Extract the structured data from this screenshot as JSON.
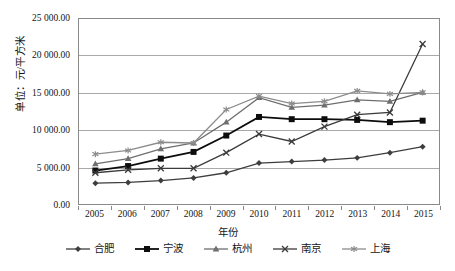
{
  "chart_data": {
    "type": "line",
    "title": "",
    "xlabel": "年份",
    "ylabel": "单位：元/平方米",
    "categories": [
      "2005",
      "2006",
      "2007",
      "2008",
      "2009",
      "2010",
      "2011",
      "2012",
      "2013",
      "2014",
      "2015"
    ],
    "ylim": [
      0,
      25000
    ],
    "ytick_labels": [
      "0.00",
      "5 000.00",
      "10 000.00",
      "15 000.00",
      "20 000.00",
      "25 000.00"
    ],
    "ytick_values": [
      0,
      5000,
      10000,
      15000,
      20000,
      25000
    ],
    "grid": true,
    "legend_position": "bottom",
    "series": [
      {
        "name": "合肥",
        "marker": "diamond",
        "color": "#3d3d3d",
        "values": [
          2800,
          2900,
          3150,
          3500,
          4200,
          5500,
          5700,
          5900,
          6200,
          6900,
          7700
        ]
      },
      {
        "name": "宁波",
        "marker": "square",
        "color": "#0d0d0d",
        "values": [
          4500,
          5100,
          6100,
          7000,
          9200,
          11700,
          11400,
          11400,
          11300,
          11000,
          11200
        ]
      },
      {
        "name": "杭州",
        "marker": "triangle",
        "color": "#6e6e6e",
        "values": [
          5400,
          6100,
          7400,
          8200,
          11000,
          14300,
          13000,
          13300,
          14000,
          13800,
          15000
        ]
      },
      {
        "name": "南京",
        "marker": "x-cross",
        "color": "#3a3a3a",
        "values": [
          4200,
          4600,
          4800,
          4800,
          6900,
          9400,
          8400,
          10400,
          12000,
          12300,
          21500
        ]
      },
      {
        "name": "上海",
        "marker": "asterisk",
        "color": "#8c8c8c",
        "values": [
          6700,
          7200,
          8300,
          8200,
          12700,
          14500,
          13500,
          13800,
          15200,
          14800,
          15000
        ]
      }
    ]
  }
}
